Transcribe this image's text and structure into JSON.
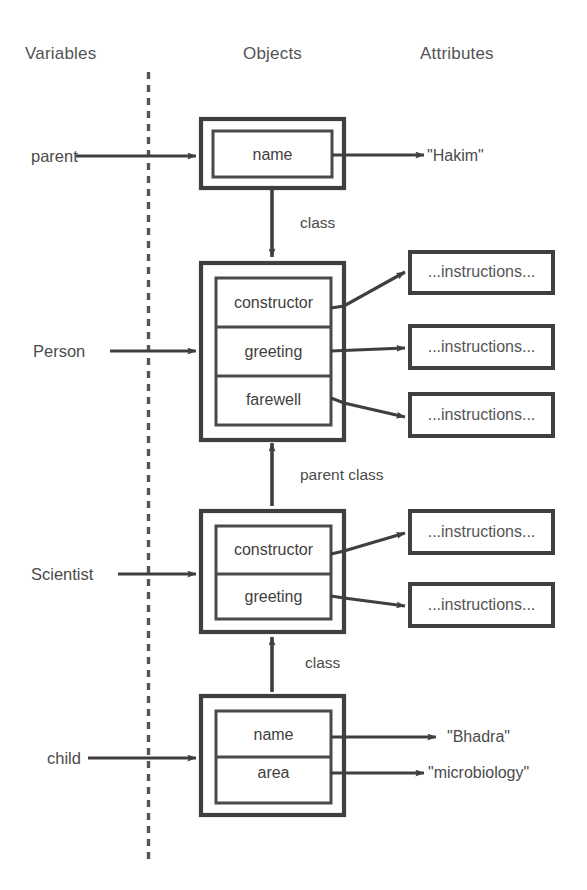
{
  "columns": {
    "variables": "Variables",
    "objects": "Objects",
    "attributes": "Attributes"
  },
  "divider": {
    "style": "dashed-vertical"
  },
  "colors": {
    "ink": "#3f3f3f",
    "text": "#4b4b4b",
    "background": "#ffffff",
    "divider": "#5a5a5a"
  },
  "variables": [
    {
      "name": "parent"
    },
    {
      "name": "Person"
    },
    {
      "name": "Scientist"
    },
    {
      "name": "child"
    }
  ],
  "objects": [
    {
      "id": "parent-object",
      "slots": [
        {
          "label": "name"
        }
      ]
    },
    {
      "id": "person-class",
      "slots": [
        {
          "label": "constructor"
        },
        {
          "label": "greeting"
        },
        {
          "label": "farewell"
        }
      ]
    },
    {
      "id": "scientist-class",
      "slots": [
        {
          "label": "constructor"
        },
        {
          "label": "greeting"
        }
      ]
    },
    {
      "id": "child-object",
      "slots": [
        {
          "label": "name"
        },
        {
          "label": "area"
        }
      ]
    }
  ],
  "attributes": {
    "parent_name_value": "\"Hakim\"",
    "child_name_value": "\"Bhadra\"",
    "child_area_value": "\"microbiology\"",
    "instructions_label": "...instructions...",
    "instruction_boxes": [
      {
        "for": "person-constructor",
        "label": "...instructions..."
      },
      {
        "for": "person-greeting",
        "label": "...instructions..."
      },
      {
        "for": "person-farewell",
        "label": "...instructions..."
      },
      {
        "for": "scientist-constructor",
        "label": "...instructions..."
      },
      {
        "for": "scientist-greeting",
        "label": "...instructions..."
      }
    ]
  },
  "edges": [
    {
      "id": "parent-to-person",
      "label": "class",
      "from": "parent-object",
      "to": "person-class"
    },
    {
      "id": "scientist-to-person",
      "label": "parent class",
      "from": "scientist-class",
      "to": "person-class"
    },
    {
      "id": "child-to-scientist",
      "label": "class",
      "from": "child-object",
      "to": "scientist-class"
    }
  ]
}
